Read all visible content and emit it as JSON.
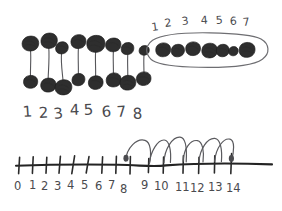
{
  "worksheet": {
    "title": "Hand-drawn counting worksheet",
    "background_color": "#ffffff",
    "ink_color": "#2b2b2b",
    "pencil_color": "#5a5a5e"
  },
  "pairs_section": {
    "name": "paired-dots-row",
    "description": "Eight vertical pairs of scribbled dots, each top dot joined to a bottom dot by a line",
    "pair_count": 8,
    "labels": [
      "1",
      "2",
      "3",
      "4",
      "5",
      "6",
      "7",
      "8"
    ],
    "pairs": [
      {
        "label": "1",
        "x": 30,
        "top_y": 44,
        "bottom_y": 82
      },
      {
        "label": "2",
        "x": 49,
        "top_y": 41,
        "bottom_y": 85
      },
      {
        "label": "3",
        "x": 62,
        "top_y": 48,
        "bottom_y": 88
      },
      {
        "label": "4",
        "x": 78,
        "top_y": 42,
        "bottom_y": 80
      },
      {
        "label": "5",
        "x": 96,
        "top_y": 45,
        "bottom_y": 83
      },
      {
        "label": "6",
        "x": 114,
        "top_y": 46,
        "bottom_y": 80
      },
      {
        "label": "7",
        "x": 128,
        "top_y": 48,
        "bottom_y": 84
      },
      {
        "label": "8",
        "x": 144,
        "top_y": 50,
        "bottom_y": 79
      }
    ]
  },
  "circled_group": {
    "name": "circled-group-of-seven",
    "description": "Seven dots enclosed in a hand-drawn oval, counted one through seven above",
    "count": 7,
    "labels": [
      "1",
      "2",
      "3",
      "4",
      "5",
      "6",
      "7"
    ],
    "dots": [
      {
        "label": "1",
        "x": 162,
        "y": 50
      },
      {
        "label": "2",
        "x": 177,
        "y": 51
      },
      {
        "label": "3",
        "x": 192,
        "y": 49
      },
      {
        "label": "4",
        "x": 209,
        "y": 51
      },
      {
        "label": "5",
        "x": 222,
        "y": 51
      },
      {
        "label": "6",
        "x": 233,
        "y": 52
      },
      {
        "label": "7",
        "x": 247,
        "y": 51
      }
    ],
    "label_positions": [
      {
        "text": "1",
        "x": 154,
        "y": 29
      },
      {
        "text": "2",
        "x": 167,
        "y": 25
      },
      {
        "text": "3",
        "x": 184,
        "y": 23
      },
      {
        "text": "4",
        "x": 204,
        "y": 22
      },
      {
        "text": "5",
        "x": 219,
        "y": 22
      },
      {
        "text": "6",
        "x": 233,
        "y": 22
      },
      {
        "text": "7",
        "x": 246,
        "y": 23
      }
    ]
  },
  "number_line": {
    "name": "number-line",
    "description": "Number line from 0 to 14 with six jump arcs running from 8 to 14",
    "min": 0,
    "max": 14,
    "tick_labels": [
      "0",
      "1",
      "2",
      "3",
      "4",
      "5",
      "6",
      "7",
      "8",
      "9",
      "10",
      "11",
      "12",
      "13",
      "14"
    ],
    "axis_y": 164,
    "start_x": 16,
    "end_x": 272,
    "hops": {
      "name": "jump-arcs",
      "count": 6,
      "from": 8,
      "to": 14,
      "steps": [
        {
          "from": "8",
          "to": "9"
        },
        {
          "from": "9",
          "to": "10"
        },
        {
          "from": "10",
          "to": "11"
        },
        {
          "from": "11",
          "to": "12"
        },
        {
          "from": "12",
          "to": "13"
        },
        {
          "from": "13",
          "to": "14"
        }
      ]
    },
    "label_offsets": [
      {
        "text": "0",
        "x": 18,
        "y": 186
      },
      {
        "text": "1",
        "x": 32,
        "y": 185
      },
      {
        "text": "2",
        "x": 45,
        "y": 186
      },
      {
        "text": "3",
        "x": 59,
        "y": 186
      },
      {
        "text": "4",
        "x": 73,
        "y": 185
      },
      {
        "text": "5",
        "x": 88,
        "y": 185
      },
      {
        "text": "6",
        "x": 102,
        "y": 186
      },
      {
        "text": "7",
        "x": 114,
        "y": 185
      },
      {
        "text": "8",
        "x": 126,
        "y": 188
      },
      {
        "text": "9",
        "x": 146,
        "y": 184
      },
      {
        "text": "10",
        "x": 158,
        "y": 186
      },
      {
        "text": "11",
        "x": 180,
        "y": 187
      },
      {
        "text": "12",
        "x": 196,
        "y": 188
      },
      {
        "text": "13",
        "x": 215,
        "y": 187
      },
      {
        "text": "14",
        "x": 233,
        "y": 188
      }
    ]
  }
}
